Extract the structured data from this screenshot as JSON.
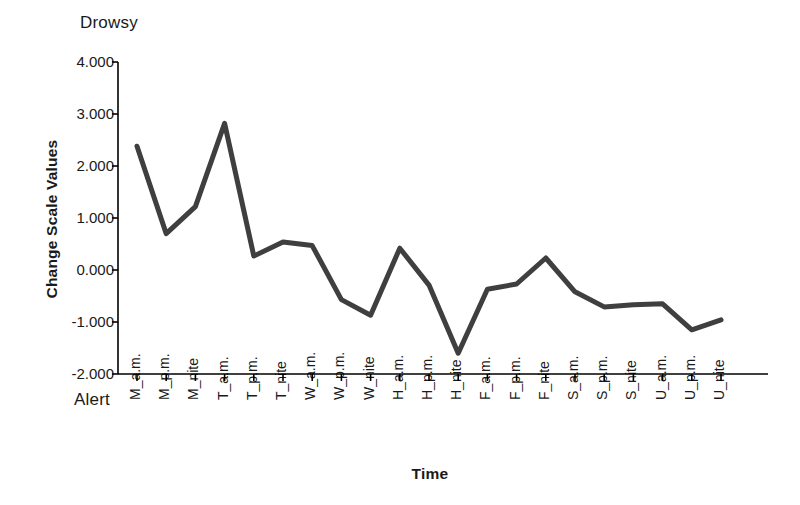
{
  "chart_data": {
    "type": "line",
    "title": "",
    "xlabel": "Time",
    "ylabel": "Change Scale Values",
    "ylim": [
      -2.0,
      4.0
    ],
    "yticks": [
      "4.000",
      "3.000",
      "2.000",
      "1.000",
      "0.000",
      "-1.000",
      "-2.000"
    ],
    "ytick_values": [
      4.0,
      3.0,
      2.0,
      1.0,
      0.0,
      -1.0,
      -2.0
    ],
    "grid": false,
    "legend": "none",
    "scale_pole_high": "Drowsy",
    "scale_pole_low": "Alert",
    "line_color": "#3f3f3f",
    "axis_color": "#000000",
    "categories": [
      "M_a.m.",
      "M_p.m.",
      "M_nite",
      "T_a.m.",
      "T_p.m.",
      "T_nite",
      "W_a.m.",
      "W_p.m.",
      "W_nite",
      "H_a.m.",
      "H_p.m.",
      "H_nite",
      "F_a.m.",
      "F_p.m.",
      "F_nite",
      "S_a.m.",
      "S_p.m.",
      "S_nite",
      "U_a.m.",
      "U_p.m.",
      "U_nite"
    ],
    "values": [
      2.38,
      0.7,
      1.22,
      2.82,
      0.27,
      0.54,
      0.47,
      -0.57,
      -0.87,
      0.42,
      -0.29,
      -1.6,
      -0.37,
      -0.27,
      0.23,
      -0.42,
      -0.71,
      -0.67,
      -0.65,
      -1.15,
      -0.96
    ]
  }
}
